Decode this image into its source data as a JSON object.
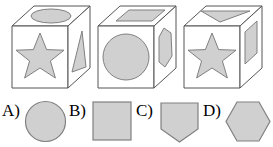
{
  "question_type": "spatial-reasoning-cube-folding",
  "colors": {
    "shape_fill": "#d0d0d0",
    "shape_stroke": "#808080",
    "cube_stroke": "#555555",
    "cube_face_fill": "#ffffff",
    "background": "#ffffff",
    "text": "#000000"
  },
  "cubes": [
    {
      "id": "cube-1",
      "name": "cube-one",
      "faces": {
        "top": "ellipse",
        "front": "star",
        "right": "triangle"
      }
    },
    {
      "id": "cube-2",
      "name": "cube-two",
      "faces": {
        "top": "rectangle",
        "front": "circle",
        "right": "hexagon"
      }
    },
    {
      "id": "cube-3",
      "name": "cube-three",
      "faces": {
        "top": "triangle",
        "front": "star",
        "right": "rectangle"
      }
    }
  ],
  "options": [
    {
      "id": "option-a",
      "label": "A)",
      "shape": "circle"
    },
    {
      "id": "option-b",
      "label": "B)",
      "shape": "square"
    },
    {
      "id": "option-c",
      "label": "C)",
      "shape": "pentagon"
    },
    {
      "id": "option-d",
      "label": "D)",
      "shape": "hexagon"
    }
  ]
}
